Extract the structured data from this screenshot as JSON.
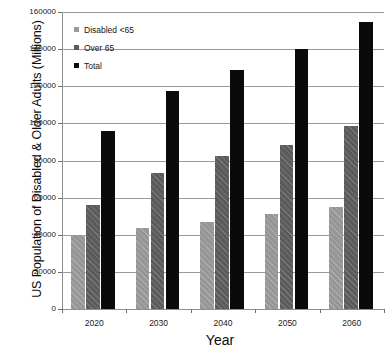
{
  "chart_data": {
    "type": "bar",
    "title": "",
    "xlabel": "Year",
    "ylabel": "US Population of Disabled & Older Adults (Millions)",
    "categories": [
      "2020",
      "2030",
      "2040",
      "2050",
      "2060"
    ],
    "series": [
      {
        "name": "Disabled <65",
        "color": "#969696",
        "values": [
          40000,
          43500,
          47000,
          51000,
          55000
        ]
      },
      {
        "name": "Over 65",
        "color": "#5b5b5b",
        "values": [
          56000,
          73500,
          82500,
          88500,
          98500
        ]
      },
      {
        "name": "Total",
        "color": "#0a0a0a",
        "values": [
          96000,
          117500,
          129000,
          140000,
          154500
        ]
      }
    ],
    "ylim": [
      0,
      160000
    ],
    "ytick_values": [
      0,
      20000,
      40000,
      60000,
      80000,
      100000,
      120000,
      140000,
      160000
    ],
    "ytick_labels": [
      "0",
      "20000",
      "40000",
      "60000",
      "80000",
      "100000",
      "120000",
      "140000",
      "160000"
    ],
    "grid": true,
    "legend_position": "top-left"
  },
  "legend": {
    "items": [
      {
        "label": "Disabled <65"
      },
      {
        "label": "Over 65"
      },
      {
        "label": "Total"
      }
    ]
  }
}
